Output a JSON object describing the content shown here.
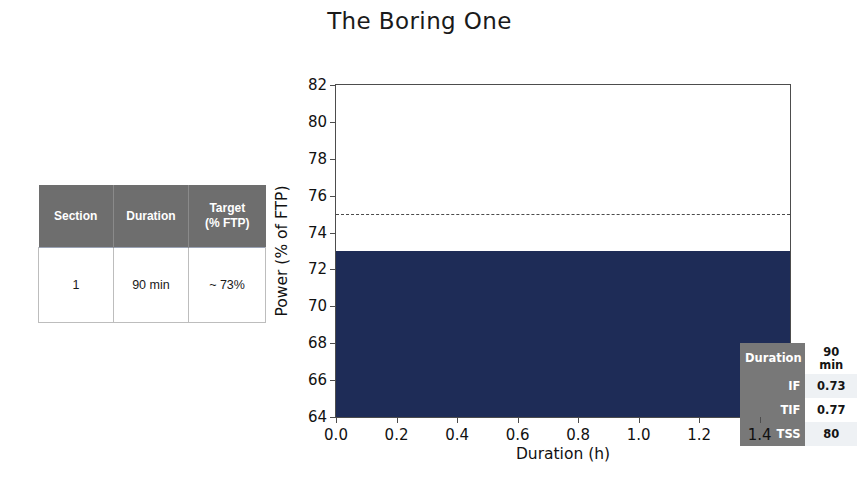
{
  "title": "The Boring One",
  "summary_table": {
    "headers": [
      "Section",
      "Duration",
      "Target\n(% FTP)"
    ],
    "header_line1": [
      "Section",
      "Duration",
      "Target"
    ],
    "header_line2": [
      "",
      "",
      "(% FTP)"
    ],
    "rows": [
      {
        "section": "1",
        "duration": "90 min",
        "target": "~ 73%"
      }
    ]
  },
  "metrics": {
    "rows": [
      {
        "key": "Duration",
        "value": "90 min"
      },
      {
        "key": "IF",
        "value": "0.73"
      },
      {
        "key": "TIF",
        "value": "0.77"
      },
      {
        "key": "TSS",
        "value": "80"
      }
    ]
  },
  "colors": {
    "bar": "#1e2c57",
    "table_header": "#6e6e6e",
    "metrics_key": "#787878",
    "axis": "#4d4d4d",
    "threshold": "#4b4b4b"
  },
  "chart_data": {
    "type": "area",
    "title": "The Boring One",
    "xlabel": "Duration (h)",
    "ylabel": "Power (% of FTP)",
    "xlim": [
      0.0,
      1.5
    ],
    "ylim": [
      64,
      82
    ],
    "xticks": [
      0.0,
      0.2,
      0.4,
      0.6,
      0.8,
      1.0,
      1.2,
      1.4
    ],
    "xtick_labels": [
      "0.0",
      "0.2",
      "0.4",
      "0.6",
      "0.8",
      "1.0",
      "1.2",
      "1.4"
    ],
    "yticks": [
      64,
      66,
      68,
      70,
      72,
      74,
      76,
      78,
      80,
      82
    ],
    "ytick_labels": [
      "64",
      "66",
      "68",
      "70",
      "72",
      "74",
      "76",
      "78",
      "80",
      "82"
    ],
    "grid": false,
    "legend": "none",
    "series": [
      {
        "name": "Power",
        "kind": "step-area",
        "color": "#1e2c57",
        "x": [
          0.0,
          1.5
        ],
        "values": [
          73,
          73
        ]
      }
    ],
    "annotations": [
      {
        "name": "ftp-threshold-line",
        "kind": "hline",
        "y": 75,
        "style": "dashed",
        "color": "#4b4b4b"
      }
    ]
  }
}
